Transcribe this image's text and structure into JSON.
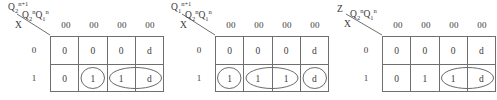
{
  "figure": {
    "name": "karnaugh-maps",
    "map_count": 3
  },
  "common": {
    "state_vars_label": "Q2nQ1n",
    "input_var_label": "X",
    "row_labels": [
      "0",
      "1"
    ],
    "column_headers": [
      "00",
      "00",
      "00",
      "00"
    ],
    "grid_line_color": "#6f6f6f",
    "text_color": "#3a3a3a",
    "oval_color": "#6a6a6a"
  },
  "maps": [
    {
      "id": "map-q2-next",
      "output_label": "Q2n+1",
      "output_base": "Q",
      "output_sub": "2",
      "output_sup": "n+1",
      "column_headers": [
        "00",
        "00",
        "00",
        "00"
      ],
      "row_labels": [
        "0",
        "1"
      ],
      "cells": [
        [
          "0",
          "0",
          "0",
          "d"
        ],
        [
          "0",
          "1",
          "1",
          "d"
        ]
      ],
      "groups": [
        {
          "name": "group-single-cell2",
          "row": 1,
          "start_col": 1,
          "span": 1
        },
        {
          "name": "group-pair-cell3-4",
          "row": 1,
          "start_col": 2,
          "span": 2
        }
      ]
    },
    {
      "id": "map-q1-next",
      "output_label": "Q1n+1",
      "output_base": "Q",
      "output_sub": "1",
      "output_sup": "n+1",
      "column_headers": [
        "00",
        "00",
        "00",
        "00"
      ],
      "row_labels": [
        "0",
        "1"
      ],
      "cells": [
        [
          "0",
          "0",
          "0",
          "d"
        ],
        [
          "1",
          "1",
          "1",
          "d"
        ]
      ],
      "groups": [
        {
          "name": "group-single-cell1",
          "row": 1,
          "start_col": 0,
          "span": 1
        },
        {
          "name": "group-pair-cell2-3",
          "row": 1,
          "start_col": 1,
          "span": 2
        },
        {
          "name": "group-single-cell4",
          "row": 1,
          "start_col": 3,
          "span": 1
        }
      ]
    },
    {
      "id": "map-z-output",
      "output_label": "Z",
      "output_base": "Z",
      "output_sub": "",
      "output_sup": "",
      "column_headers": [
        "00",
        "00",
        "00",
        "00"
      ],
      "row_labels": [
        "0",
        "1"
      ],
      "cells": [
        [
          "0",
          "0",
          "0",
          "d"
        ],
        [
          "0",
          "1",
          "1",
          "d"
        ]
      ],
      "groups": [
        {
          "name": "group-pair-cell3-4",
          "row": 1,
          "start_col": 2,
          "span": 2
        }
      ]
    }
  ]
}
